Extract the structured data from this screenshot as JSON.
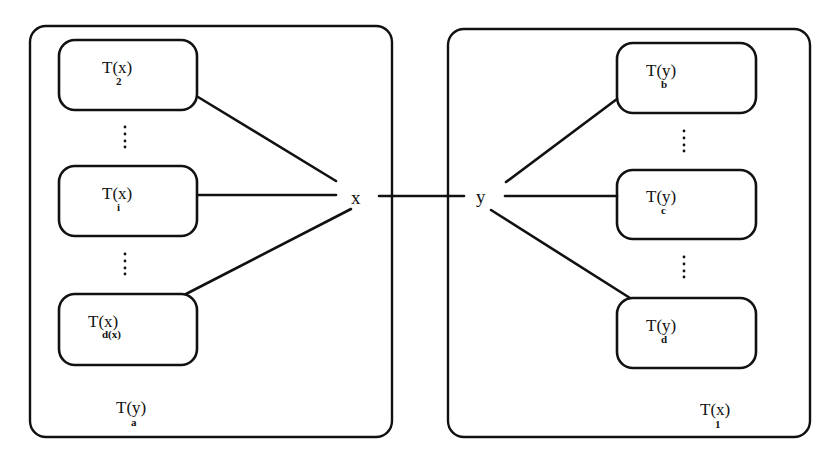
{
  "diagram": {
    "type": "tree-edge-decomposition",
    "nodes": {
      "x": {
        "label": "x"
      },
      "y": {
        "label": "y"
      }
    },
    "left_container": {
      "label": {
        "main": "T(y)",
        "sub": "a"
      },
      "subtrees": [
        {
          "main": "T(x)",
          "sub": "2"
        },
        {
          "main": "T(x)",
          "sub": "i"
        },
        {
          "main": "T(x)",
          "sub": "d(x)"
        }
      ],
      "ellipsis": [
        "⋮",
        "⋮"
      ]
    },
    "right_container": {
      "label": {
        "main": "T(x)",
        "sub": "1"
      },
      "subtrees": [
        {
          "main": "T(y)",
          "sub": "b"
        },
        {
          "main": "T(y)",
          "sub": "c"
        },
        {
          "main": "T(y)",
          "sub": "d"
        }
      ],
      "ellipsis": [
        "⋮",
        "⋮"
      ]
    },
    "edges": [
      {
        "from": "x",
        "to": "T(x)_2"
      },
      {
        "from": "x",
        "to": "T(x)_i"
      },
      {
        "from": "x",
        "to": "T(x)_d(x)"
      },
      {
        "from": "x",
        "to": "y"
      },
      {
        "from": "y",
        "to": "T(y)_b"
      },
      {
        "from": "y",
        "to": "T(y)_c"
      },
      {
        "from": "y",
        "to": "T(y)_d"
      }
    ],
    "colors": {
      "stroke": "#111111",
      "background": "#ffffff"
    }
  }
}
